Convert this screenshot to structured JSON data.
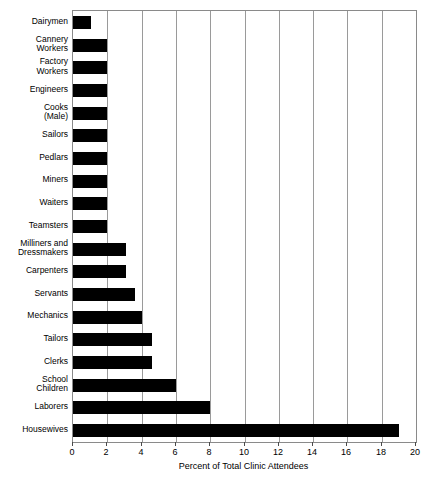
{
  "chart_data": {
    "type": "bar",
    "orientation": "horizontal",
    "title": "",
    "xlabel": "Percent of Total Clinic Attendees",
    "ylabel": "",
    "xlim": [
      0,
      20
    ],
    "xticks": [
      0,
      2,
      4,
      6,
      8,
      10,
      12,
      14,
      16,
      18,
      20
    ],
    "grid": true,
    "legend": null,
    "bar_color": "#000000",
    "categories": [
      "Dairymen",
      "Cannery\nWorkers",
      "Factory\nWorkers",
      "Engineers",
      "Cooks\n(Male)",
      "Sailors",
      "Pedlars",
      "Miners",
      "Waiters",
      "Teamsters",
      "Milliners and\nDressmakers",
      "Carpenters",
      "Servants",
      "Mechanics",
      "Tailors",
      "Clerks",
      "School\nChildren",
      "Laborers",
      "Housewives"
    ],
    "values": [
      1.05,
      2.0,
      2.0,
      2.0,
      2.0,
      2.0,
      2.0,
      2.0,
      2.0,
      2.0,
      3.1,
      3.1,
      3.6,
      4.0,
      4.6,
      4.6,
      6.0,
      8.0,
      19.0
    ]
  }
}
